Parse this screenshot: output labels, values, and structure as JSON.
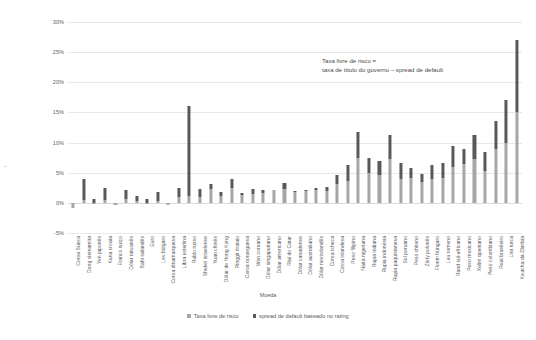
{
  "chart_data": {
    "type": "bar",
    "subtype": "stacked-column",
    "title": "",
    "xlabel": "Moeda",
    "ylabel": "Taxa livre de risco (títulos de governo)",
    "ylim": [
      -5,
      30
    ],
    "ytick_values": [
      30,
      25,
      20,
      15,
      10,
      5,
      0,
      -5
    ],
    "ytick_labels": [
      "30%",
      "25%",
      "20%",
      "15%",
      "10%",
      "5%",
      "0%",
      "-5%"
    ],
    "grid": true,
    "legend_position": "bottom",
    "annotation": {
      "line1": "Taxa livre de risco =",
      "line2": "taxa de título do governo – spread de default"
    },
    "colors": {
      "risk_free": "#a6a6a6",
      "default_spread": "#595959",
      "gridline": "#e8e8e8",
      "text": "#5a5a5a"
    },
    "categories": [
      "Coroa Sueca",
      "Dong vietnamita",
      "Yen japonês",
      "Kuna croata",
      "Franco suíço",
      "Dólar taiwanês",
      "Baht tailandês",
      "Euro",
      "Lev búlgaro",
      "Coroa dinamarquesa",
      "Libra esterlina",
      "Rublo russo",
      "Shekel israelense",
      "Yuan chinês",
      "Dólar de Hong Kong",
      "Ringgit malaio",
      "Coroa norueguesa",
      "Won coreano",
      "Dólar singapuriano",
      "Dólar americano",
      "Rial do Catar",
      "Dólar canadense",
      "Dólar australiano",
      "Dólar neozelandês",
      "Coroa tcheca",
      "Coroa islandesa",
      "Peso filipino",
      "Naira nigeriana",
      "Rupia indiana",
      "Rupia indonésia",
      "Rupia paquistanesa",
      "Sol peruano",
      "Peso chileno",
      "Zloty polonês",
      "Florim húngaro",
      "Leu romeno",
      "Rand sul-africano",
      "Peso mexicano",
      "Xelim queniano",
      "Peso colombiano",
      "Real brasileiro",
      "Lira turca",
      "Kwacha da Zâmbia"
    ],
    "series": [
      {
        "name": "Taxa livre de risco",
        "color": "#a6a6a6",
        "values": [
          -0.9,
          0.5,
          -0.1,
          0.4,
          -0.4,
          0.6,
          0.3,
          -0.2,
          0.3,
          -0.3,
          0.9,
          1.2,
          0.9,
          2.3,
          1.1,
          2.4,
          1.3,
          1.5,
          1.7,
          2.2,
          2.3,
          1.8,
          1.9,
          2.2,
          1.9,
          3.1,
          3.7,
          7.5,
          5.0,
          4.6,
          7.2,
          4.0,
          4.2,
          3.5,
          4.0,
          4.2,
          6.0,
          6.5,
          7.3,
          5.3,
          9.0,
          10.0,
          15.0
        ]
      },
      {
        "name": "spread de default baseado no rating",
        "color": "#595959",
        "values": [
          0.0,
          3.4,
          0.6,
          2.0,
          0.0,
          1.6,
          0.8,
          0.6,
          1.5,
          0.0,
          1.5,
          14.8,
          1.4,
          0.9,
          0.7,
          1.6,
          0.3,
          0.8,
          0.4,
          0.0,
          1.0,
          0.2,
          0.2,
          0.3,
          0.8,
          1.5,
          2.6,
          4.3,
          2.5,
          2.4,
          4.0,
          2.6,
          1.6,
          1.3,
          2.3,
          2.4,
          3.5,
          2.4,
          4.0,
          3.2,
          4.5,
          7.0,
          12.0
        ]
      }
    ]
  },
  "legend": {
    "items": [
      {
        "label": "Taxa livre de risco",
        "color": "#a6a6a6"
      },
      {
        "label": "spread de default baseado no rating",
        "color": "#595959"
      }
    ]
  }
}
